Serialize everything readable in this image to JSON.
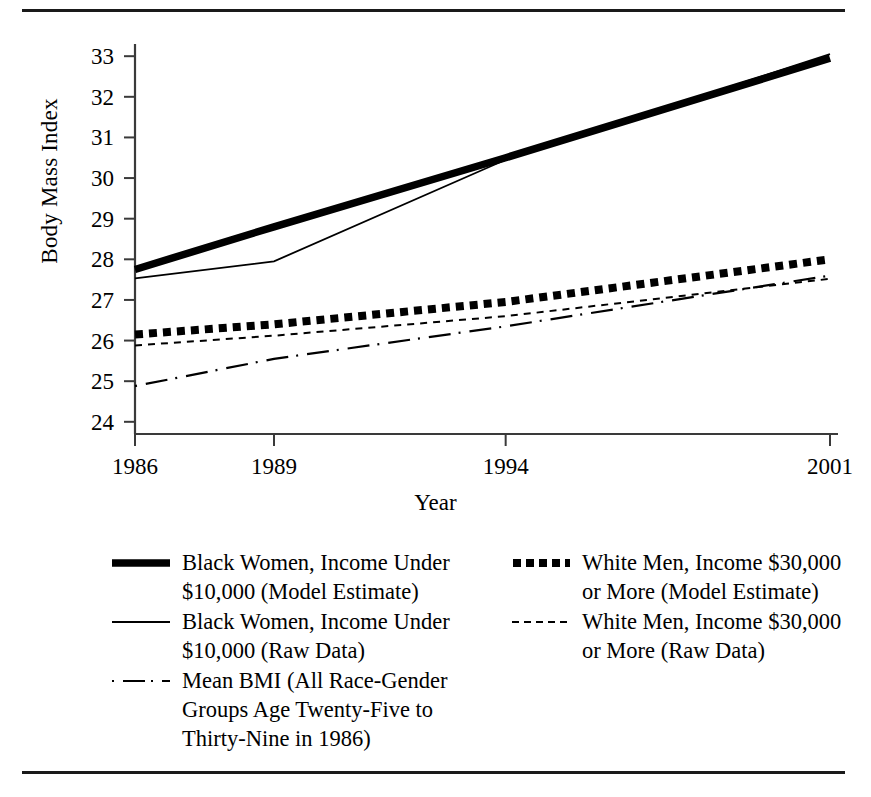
{
  "figure": {
    "ylabel": "Body Mass Index",
    "xlabel": "Year"
  },
  "chart_data": {
    "type": "line",
    "title": "",
    "xlabel": "Year",
    "ylabel": "Body Mass Index",
    "x": [
      1986,
      1989,
      1994,
      2001
    ],
    "xticklabels": [
      "1986",
      "1989",
      "1994",
      "2001"
    ],
    "yticks": [
      24,
      25,
      26,
      27,
      28,
      29,
      30,
      31,
      32,
      33
    ],
    "yticklabels": [
      "24",
      "25",
      "26",
      "27",
      "28",
      "29",
      "30",
      "31",
      "32",
      "33"
    ],
    "xlim": [
      1986,
      2001
    ],
    "ylim": [
      23.7,
      33.3
    ],
    "grid": false,
    "legend_position": "below-plot-two-columns",
    "series": [
      {
        "name": "Black Women, Income Under $10,000 (Model Estimate)",
        "style": "thick-solid",
        "values": [
          27.75,
          28.8,
          30.5,
          32.95
        ]
      },
      {
        "name": "Black Women, Income Under $10,000 (Raw Data)",
        "style": "thin-solid",
        "values": [
          27.53,
          27.95,
          30.45,
          33.05
        ]
      },
      {
        "name": "White Men, Income $30,000 or More (Model Estimate)",
        "style": "thick-dotted",
        "values": [
          26.15,
          26.4,
          26.95,
          28.0
        ]
      },
      {
        "name": "White Men, Income $30,000 or More (Raw Data)",
        "style": "thin-dashed",
        "values": [
          25.88,
          26.12,
          26.6,
          27.52
        ]
      },
      {
        "name": "Mean BMI (All Race-Gender Groups Age Twenty-Five to Thirty-Nine in 1986)",
        "style": "dash-dot",
        "values": [
          24.88,
          25.55,
          26.35,
          27.6
        ]
      }
    ]
  },
  "legend": {
    "columns": [
      {
        "items": [
          {
            "swatch": "thick-solid-line-swatch",
            "label": "Black Women, Income Under\n$10,000 (Model Estimate)"
          },
          {
            "swatch": "thin-solid-line-swatch",
            "label": "Black Women, Income Under\n$10,000 (Raw Data)"
          },
          {
            "swatch": "dash-dot-line-swatch",
            "label": "Mean BMI (All Race-Gender\nGroups Age Twenty-Five to\nThirty-Nine in 1986)"
          }
        ]
      },
      {
        "items": [
          {
            "swatch": "thick-dotted-line-swatch",
            "label": "White Men, Income $30,000\nor More (Model Estimate)"
          },
          {
            "swatch": "thin-dashed-line-swatch",
            "label": "White Men, Income $30,000\nor More (Raw Data)"
          }
        ]
      }
    ]
  },
  "colors": {
    "ink": "#000000",
    "rule": "#1a1a1a"
  }
}
